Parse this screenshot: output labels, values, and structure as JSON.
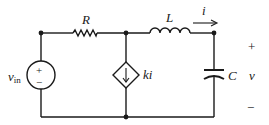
{
  "diagram": {
    "type": "circuit",
    "components": {
      "source": {
        "label_main": "v",
        "label_sub": "in",
        "plus": "+",
        "minus": "−"
      },
      "resistor": {
        "label": "R"
      },
      "inductor": {
        "label": "L"
      },
      "current_arrow": {
        "label": "i"
      },
      "dependent_source": {
        "label": "ki"
      },
      "capacitor": {
        "label": "C"
      },
      "output": {
        "plus": "+",
        "label": "v",
        "minus": "−"
      }
    },
    "colors": {
      "ink": "#1a1a1a",
      "background": "#ffffff"
    }
  }
}
